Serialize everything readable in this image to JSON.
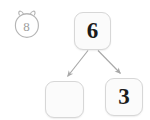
{
  "page": {
    "background_color": "#ffffff"
  },
  "avatar": {
    "icon": "bear-face-icon",
    "value": "8",
    "outline_color": "#b3b3b3",
    "text_color": "#9d9d9d"
  },
  "diagram": {
    "type": "number-bond",
    "box_fill": "#fbfbfb",
    "box_border": "#d7d7d7",
    "arrow_color": "#a8a8a8",
    "nodes": [
      {
        "id": "whole",
        "role": "whole",
        "value": "6",
        "empty": false
      },
      {
        "id": "part-left",
        "role": "part",
        "value": "",
        "empty": true
      },
      {
        "id": "part-right",
        "role": "part",
        "value": "3",
        "empty": false
      }
    ],
    "connectors": [
      {
        "from": "whole",
        "to": "part-left",
        "arrow": "down-left"
      },
      {
        "from": "whole",
        "to": "part-right",
        "arrow": "down-right"
      }
    ]
  }
}
